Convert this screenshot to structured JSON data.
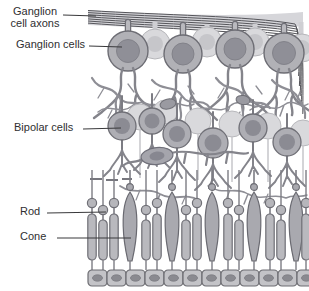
{
  "figure": {
    "name": "Retina cross-section diagram",
    "labels": {
      "ganglion_axons": "Ganglion cell axons",
      "ganglion_cells": "Ganglion cells",
      "bipolar_cells": "Bipolar cells",
      "rod": "Rod",
      "cone": "Cone"
    },
    "colors": {
      "cell_fill": "#b1b1b6",
      "cell_outline": "#6d6d74",
      "nucleus": "#8f8f97",
      "background_cell": "#d9d9dc",
      "fiber": "#8e8e95",
      "label_text": "#2f2f31",
      "leader_line": "#3a3a3c",
      "background": "#ffffff"
    }
  }
}
